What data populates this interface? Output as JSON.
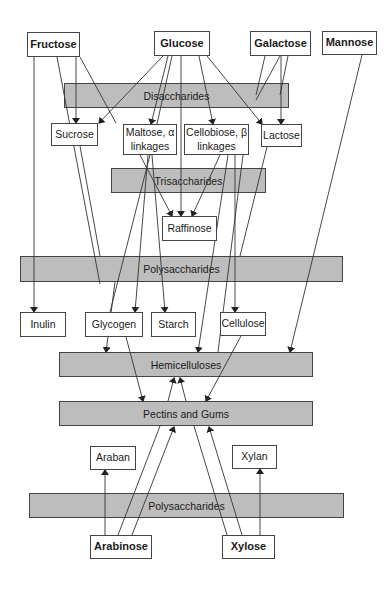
{
  "diagram": {
    "monosaccharides": {
      "fructose": "Fructose",
      "glucose": "Glucose",
      "galactose": "Galactose",
      "mannose": "Mannose",
      "arabinose": "Arabinose",
      "xylose": "Xylose"
    },
    "categories": {
      "disaccharides": "Disaccharides",
      "trisaccharides": "Trisaccharides",
      "polysaccharides_top": "Polysaccharides",
      "hemicelluloses": "Hemicelluloses",
      "pectins_gums": "Pectins and Gums",
      "polysaccharides_bottom": "Polysaccharides"
    },
    "products": {
      "sucrose": "Sucrose",
      "maltose": "Maltose, α\nlinkages",
      "cellobiose": "Cellobiose, β\nlinkages",
      "lactose": "Lactose",
      "raffinose": "Raffinose",
      "inulin": "Inulin",
      "glycogen": "Glycogen",
      "starch": "Starch",
      "cellulose": "Cellulose",
      "araban": "Araban",
      "xylan": "Xylan"
    },
    "colors": {
      "band_fill": "#bdbdbd",
      "stroke": "#444444",
      "node_fill": "#ffffff"
    }
  }
}
